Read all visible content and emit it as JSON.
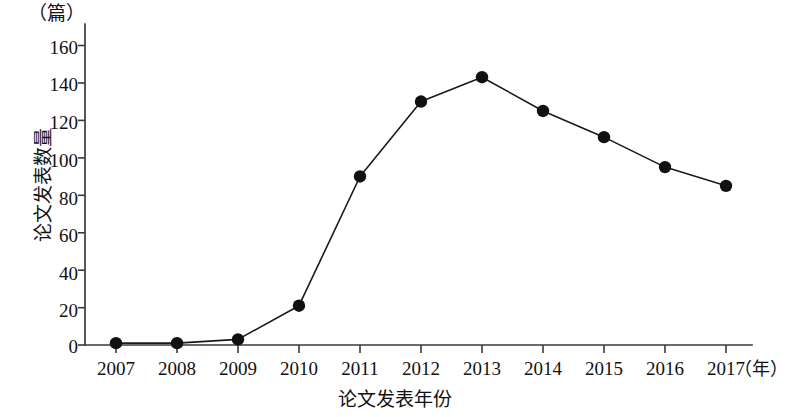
{
  "chart_data": {
    "type": "line",
    "title": "",
    "xlabel": "论文发表年份",
    "ylabel": "论文发表数量",
    "x_unit": "（年）",
    "y_unit": "（篇）",
    "categories": [
      "2007",
      "2008",
      "2009",
      "2010",
      "2011",
      "2012",
      "2013",
      "2014",
      "2015",
      "2016",
      "2017"
    ],
    "values": [
      1,
      1,
      3,
      21,
      90,
      130,
      143,
      125,
      111,
      95,
      85
    ],
    "series": [
      {
        "name": "论文发表数量",
        "values": [
          1,
          1,
          3,
          21,
          90,
          130,
          143,
          125,
          111,
          95,
          85
        ]
      }
    ],
    "ylim": [
      0,
      170
    ],
    "y_ticks": [
      "0",
      "20",
      "40",
      "60",
      "80",
      "100",
      "120",
      "140",
      "160"
    ],
    "y_tick_values": [
      0,
      20,
      40,
      60,
      80,
      100,
      120,
      140,
      160
    ],
    "xlim": [
      "2007",
      "2017"
    ],
    "grid": false,
    "legend": false,
    "legend_position": "none",
    "marker": "filled-circle",
    "line_color": "#111111",
    "marker_color": "#111111",
    "axis_color": "#3a3a3a",
    "background_color": "#ffffff"
  }
}
